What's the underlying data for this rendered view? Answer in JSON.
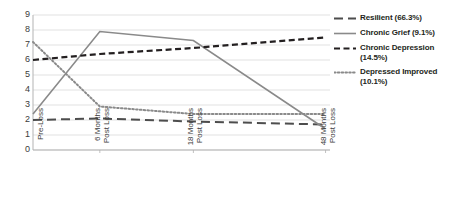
{
  "chart_data": {
    "type": "line",
    "title": "",
    "subtitle": "",
    "xlabel": "",
    "ylabel": "",
    "ylim": [
      0,
      9
    ],
    "yticks": [
      0,
      1,
      2,
      3,
      4,
      5,
      6,
      7,
      8,
      9
    ],
    "grid": true,
    "legend_position": "right",
    "categories": [
      "Pre-Loss",
      "6 Months Post Loss",
      "18 Months Post Loss",
      "48 Months Post Loss"
    ],
    "x_tick_labels": [
      {
        "line1": "Pre-Loss",
        "line2": ""
      },
      {
        "line1": "6 Months",
        "line2": "Post Loss"
      },
      {
        "line1": "18 Months",
        "line2": "Post Loss"
      },
      {
        "line1": "48 Months",
        "line2": "Post Loss"
      }
    ],
    "series": [
      {
        "name": "Resilient (66.3%)",
        "short_name": "Resilient",
        "percent": "66.3%",
        "style": "long-dash",
        "color": "#4d4d4d",
        "values": [
          2.0,
          2.1,
          1.9,
          1.7
        ]
      },
      {
        "name": "Chronic Grief (9.1%)",
        "short_name": "Chronic Grief",
        "percent": "9.1%",
        "style": "solid",
        "color": "#8a8a8a",
        "values": [
          2.4,
          7.9,
          7.3,
          1.4
        ]
      },
      {
        "name": "Chronic Depression (14.5%)",
        "short_name": "Chronic Depression",
        "percent": "14.5%",
        "style": "dash",
        "color": "#231f20",
        "values": [
          6.0,
          6.4,
          6.8,
          7.5
        ]
      },
      {
        "name": "Depressed Improved (10.1%)",
        "short_name": "Depressed Improved",
        "percent": "10.1%",
        "style": "dotted",
        "color": "#8a8a8a",
        "values": [
          7.2,
          2.9,
          2.4,
          2.4
        ]
      }
    ]
  },
  "legend": {
    "entries": [
      {
        "label_line1": "Resilient (66.3%)",
        "label_line2": ""
      },
      {
        "label_line1": "Chronic Grief (9.1%)",
        "label_line2": ""
      },
      {
        "label_line1": "Chronic Depression",
        "label_line2": "(14.5%)"
      },
      {
        "label_line1": "Depressed Improved",
        "label_line2": "(10.1%)"
      }
    ]
  },
  "axes": {
    "y_tick_labels": [
      "9",
      "8",
      "7",
      "6",
      "5",
      "4",
      "3",
      "2",
      "1",
      "0"
    ]
  }
}
